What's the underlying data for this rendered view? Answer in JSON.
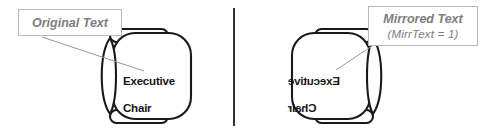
{
  "figure": {
    "background_color": "#ffffff",
    "divider": {
      "name": "vertical-divider",
      "color": "#1a1a1a",
      "x": 234,
      "y_top": 8,
      "y_bottom": 126
    }
  },
  "panels": [
    {
      "id": "left",
      "side": "left",
      "callout": {
        "line1": "Original Text",
        "line2": "",
        "border_color": "#b9b9b9",
        "text_color": "#7d7d7d"
      },
      "chair": {
        "label": "Executive\nChair",
        "label_line1": "Executive",
        "label_line2": "Chair",
        "mirrored": false,
        "outline_color": "#1a1a1a",
        "backrest_side": "left"
      },
      "leader_line": {
        "name": "leader-line-original",
        "color": "#9a9a9a"
      }
    },
    {
      "id": "right",
      "side": "right",
      "callout": {
        "line1": "Mirrored Text",
        "line2": "(MirrText = 1)",
        "border_color": "#b9b9b9",
        "text_color": "#7d7d7d"
      },
      "chair": {
        "label": "Executive\nChair",
        "label_line1": "Executive",
        "label_line2": "Chair",
        "mirrored": true,
        "outline_color": "#1a1a1a",
        "backrest_side": "right"
      },
      "leader_line": {
        "name": "leader-line-mirrored",
        "color": "#9a9a9a"
      }
    }
  ]
}
